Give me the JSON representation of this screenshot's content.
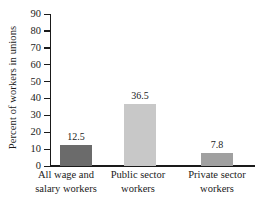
{
  "chart_data": {
    "type": "bar",
    "title": "",
    "xlabel": "",
    "ylabel": "Percent of workers in unions",
    "ylim": [
      0,
      90
    ],
    "grid": false,
    "legend": "none",
    "categories": [
      "All wage and salary workers",
      "Public sector workers",
      "Private sector workers"
    ],
    "category_lines": [
      [
        "All wage and",
        "salary workers"
      ],
      [
        "Public sector",
        "workers"
      ],
      [
        "Private sector",
        "workers"
      ]
    ],
    "values": [
      12.5,
      36.5,
      7.8
    ],
    "value_labels": [
      "12.5",
      "36.5",
      "7.8"
    ],
    "bar_colors": [
      "#6b6b6b",
      "#c8c8c8",
      "#a0a0a0"
    ],
    "ytick_labels": [
      "90",
      "80",
      "70",
      "60",
      "50",
      "40",
      "30",
      "20",
      "10",
      "0"
    ],
    "ytick_values": [
      90,
      80,
      70,
      60,
      50,
      40,
      30,
      20,
      10,
      0
    ],
    "axis_color": "#1a1a1a",
    "background_color": "#ffffff"
  }
}
